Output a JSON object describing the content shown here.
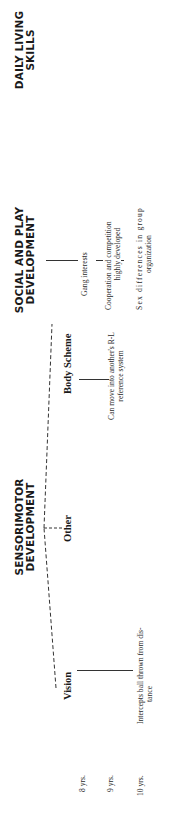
{
  "headers": {
    "sensorimotor": [
      "SENSORIMOTOR",
      "DEVELOPMENT"
    ],
    "social_play": [
      "SOCIAL AND PLAY",
      "DEVELOPMENT"
    ],
    "daily_living": [
      "DAILY LIVING",
      "SKILLS"
    ]
  },
  "sensorimotor_subheads": {
    "vision": "Vision",
    "other": "Other",
    "body_scheme": "Body Scheme"
  },
  "ages": [
    "8 yrs.",
    "9 yrs.",
    "10 yrs."
  ],
  "entries": {
    "vision_10": [
      "Intercepts ball thrown from dis-",
      "tance"
    ],
    "body_scheme_9": [
      "Can move into another's R-L",
      "reference system"
    ],
    "social_8": "Gang interests",
    "social_9": [
      "Cooperation and competition",
      "highly developed"
    ],
    "social_10": [
      "Sex differences in group",
      "organization"
    ]
  }
}
